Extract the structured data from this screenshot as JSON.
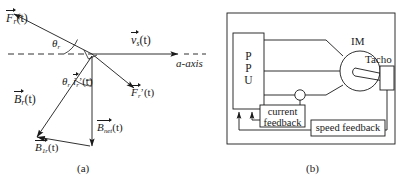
{
  "figure": {
    "captions": {
      "left": "(a)",
      "right": "(b)"
    }
  },
  "diagram_a": {
    "name": "rotor-phasor-vector-diagram",
    "axis_label": "a-axis",
    "vectors": [
      {
        "id": "Fr",
        "base": "F",
        "sub": "r",
        "prime": false,
        "arg": "(t)",
        "text": "F_r(t)"
      },
      {
        "id": "vs",
        "base": "v",
        "sub": "s",
        "prime": false,
        "arg": "(t)",
        "text": "v_s(t)"
      },
      {
        "id": "irp",
        "base": "i",
        "sub": "r",
        "prime": true,
        "arg": "(t)",
        "text": "i_r'(t)"
      },
      {
        "id": "Frp",
        "base": "F",
        "sub": "r",
        "prime": true,
        "arg": "(t)",
        "text": "F_r'(t)"
      },
      {
        "id": "Br",
        "base": "B",
        "sub": "r",
        "prime": false,
        "arg": "(t)",
        "text": "B_r(t)"
      },
      {
        "id": "Bnet",
        "base": "B",
        "sub": "net",
        "prime": false,
        "arg": "(t)",
        "text": "B_net(t)"
      },
      {
        "id": "B1r",
        "base": "B",
        "sub": "1r",
        "prime": false,
        "arg": "(t)",
        "text": "B_1r(t)"
      }
    ],
    "angles": [
      {
        "id": "theta-r-upper",
        "base": "θ",
        "sub": "r"
      },
      {
        "id": "theta-r-lower",
        "base": "θ",
        "sub": "r"
      }
    ]
  },
  "diagram_b": {
    "name": "induction-motor-drive-block-diagram",
    "ppu_label_lines": [
      "P",
      "P",
      "U"
    ],
    "im_label": "IM",
    "tacho_label": "Tacho",
    "current_feedback_label_lines": [
      "current",
      "feedback"
    ],
    "speed_feedback_label": "speed feedback"
  },
  "colors": {
    "line": "#1a1a1a",
    "text": "#1a1a1a",
    "background": "#ffffff"
  }
}
